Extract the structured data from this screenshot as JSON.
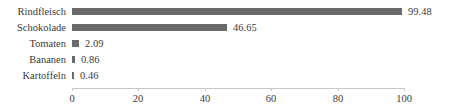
{
  "chart_data": {
    "type": "bar",
    "orientation": "horizontal",
    "title": "",
    "subtitle": "",
    "xlabel": "",
    "ylabel": "",
    "categories": [
      "Rindfleisch",
      "Schokolade",
      "Tomaten",
      "Bananen",
      "Kartoffeln"
    ],
    "values": [
      99.48,
      46.65,
      2.09,
      0.86,
      0.46
    ],
    "data_labels": [
      "99.48",
      "46.65",
      "2.09",
      "0.86",
      "0.46"
    ],
    "xlim": [
      0,
      100
    ],
    "xticks": [
      0,
      20,
      40,
      60,
      80,
      100
    ],
    "xtick_labels": [
      "0",
      "20",
      "40",
      "60",
      "80",
      "100"
    ],
    "grid": false,
    "legend": null,
    "bar_color": "#6b6b6b",
    "axis_color": "#c8c8c8",
    "text_color": "#3a3a3a",
    "background": "#ffffff"
  }
}
